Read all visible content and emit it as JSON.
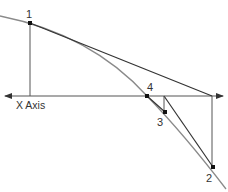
{
  "diagram": {
    "axis_label": "X Axis",
    "points": [
      {
        "id": "1",
        "label": "1",
        "x": 30,
        "y": 23
      },
      {
        "id": "2",
        "label": "2",
        "x": 213,
        "y": 167
      },
      {
        "id": "3",
        "label": "3",
        "x": 165,
        "y": 112
      },
      {
        "id": "4",
        "label": "4",
        "x": 147,
        "y": 96
      }
    ],
    "colors": {
      "curve": "#8a8a8a",
      "tangent": "#333333",
      "axis": "#555555",
      "point": "#111111",
      "text": "#333333"
    }
  }
}
